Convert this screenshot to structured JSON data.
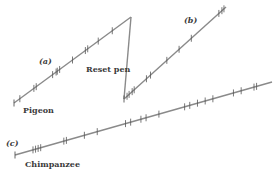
{
  "diagram": {
    "type": "cumulative-record",
    "records": [
      {
        "id": "a",
        "label": "(a)",
        "subject": "Pigeon",
        "ticks": [
          0.05,
          0.17,
          0.19,
          0.33,
          0.36,
          0.37,
          0.39,
          0.5,
          0.61,
          0.63,
          0.72,
          0.84
        ]
      },
      {
        "id": "b",
        "label": "(b)",
        "subject": "",
        "ticks": [
          0.03,
          0.05,
          0.08,
          0.1,
          0.22,
          0.26,
          0.42,
          0.54,
          0.66,
          0.93,
          0.96,
          0.98
        ]
      },
      {
        "id": "c",
        "label": "(c)",
        "subject": "Chimpanzee",
        "ticks": [
          0.07,
          0.08,
          0.09,
          0.1,
          0.19,
          0.2,
          0.27,
          0.32,
          0.43,
          0.45,
          0.49,
          0.51,
          0.56,
          0.66,
          0.68,
          0.71,
          0.74,
          0.77,
          0.85,
          0.88,
          0.93,
          0.94
        ]
      }
    ],
    "annotation": "Reset pen",
    "colors": {
      "line": "#8a8a8a",
      "tick": "#555555",
      "text": "#3a3a3a"
    }
  }
}
